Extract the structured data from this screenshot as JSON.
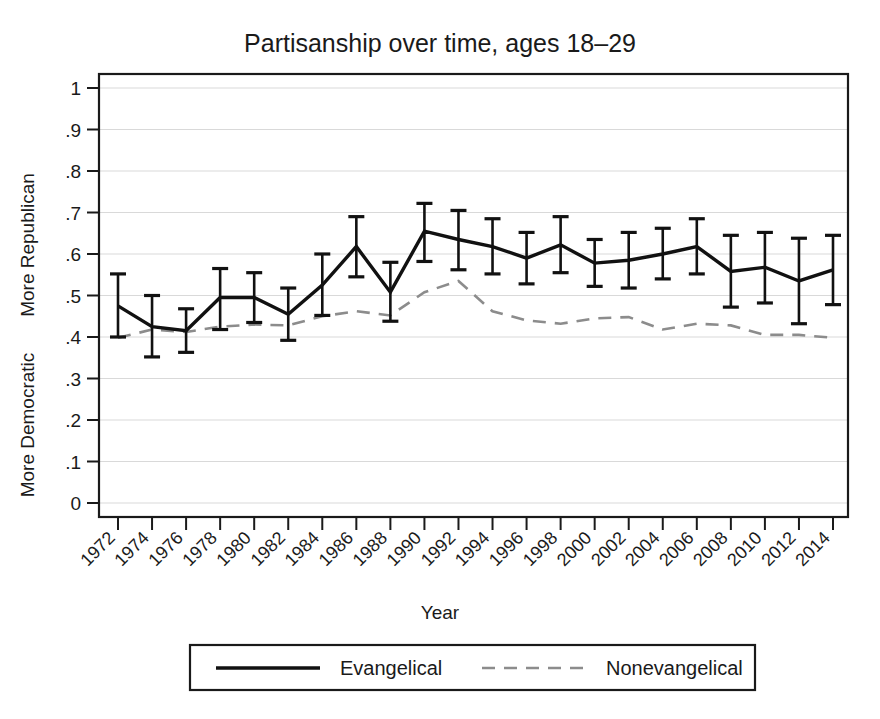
{
  "chart_data": {
    "type": "line",
    "title": "Partisanship over time, ages 18–29",
    "xlabel": "Year",
    "ylabel_top": "More Republican",
    "ylabel_bottom": "More Democratic",
    "xlim": [
      1971,
      2015
    ],
    "ylim": [
      0,
      1
    ],
    "yticks": [
      0,
      0.1,
      0.2,
      0.3,
      0.4,
      0.5,
      0.6,
      0.7,
      0.8,
      0.9,
      1
    ],
    "ytick_labels": [
      "0",
      ".1",
      ".2",
      ".3",
      ".4",
      ".5",
      ".6",
      ".7",
      ".8",
      ".9",
      "1"
    ],
    "grid": true,
    "grid_axis": "y",
    "legend_position": "bottom",
    "x": [
      1972,
      1974,
      1976,
      1978,
      1980,
      1982,
      1984,
      1986,
      1988,
      1990,
      1992,
      1994,
      1996,
      1998,
      2000,
      2002,
      2004,
      2006,
      2008,
      2010,
      2012,
      2014
    ],
    "xtick_labels": [
      "1972",
      "1974",
      "1976",
      "1978",
      "1980",
      "1982",
      "1984",
      "1986",
      "1988",
      "1990",
      "1992",
      "1994",
      "1996",
      "1998",
      "2000",
      "2002",
      "2004",
      "2006",
      "2008",
      "2010",
      "2012",
      "2014"
    ],
    "series": [
      {
        "name": "Evangelical",
        "style": "solid",
        "color": "#111111",
        "has_error_bars": true,
        "values": [
          0.475,
          0.425,
          0.415,
          0.495,
          0.495,
          0.455,
          0.525,
          0.618,
          0.508,
          0.655,
          0.635,
          0.618,
          0.59,
          0.622,
          0.578,
          0.585,
          0.6,
          0.618,
          0.558,
          0.568,
          0.535,
          0.562
        ],
        "error_low": [
          0.4,
          0.352,
          0.363,
          0.418,
          0.435,
          0.392,
          0.452,
          0.545,
          0.438,
          0.582,
          0.562,
          0.552,
          0.528,
          0.555,
          0.522,
          0.518,
          0.54,
          0.552,
          0.472,
          0.482,
          0.432,
          0.478
        ],
        "error_high": [
          0.552,
          0.5,
          0.468,
          0.565,
          0.555,
          0.518,
          0.6,
          0.69,
          0.58,
          0.722,
          0.705,
          0.685,
          0.652,
          0.69,
          0.635,
          0.652,
          0.662,
          0.685,
          0.645,
          0.652,
          0.638,
          0.645
        ]
      },
      {
        "name": "Nonevangelical",
        "style": "dashed",
        "color": "#8c8c8c",
        "has_error_bars": false,
        "values": [
          0.398,
          0.418,
          0.412,
          0.425,
          0.43,
          0.428,
          0.45,
          0.462,
          0.452,
          0.508,
          0.535,
          0.462,
          0.44,
          0.432,
          0.445,
          0.448,
          0.418,
          0.432,
          0.428,
          0.405,
          0.405,
          0.398
        ]
      }
    ]
  },
  "legend": {
    "entries": [
      {
        "label": "Evangelical",
        "marker": "solid-line"
      },
      {
        "label": "Nonevangelical",
        "marker": "dashed-line"
      }
    ]
  }
}
